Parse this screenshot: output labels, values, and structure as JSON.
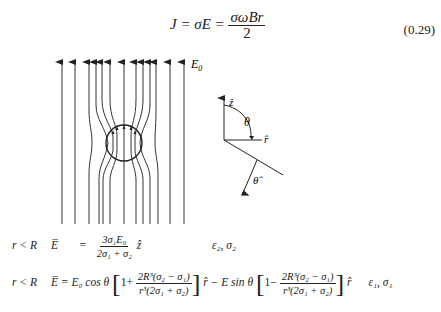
{
  "equation_top": {
    "lhs": "J = σE =",
    "fraction_numerator": "σωBr",
    "fraction_denominator": "2",
    "number": "(0.29)"
  },
  "figure": {
    "field_label": "E",
    "field_label_sub": "0",
    "field_line_x": [
      62,
      75,
      89,
      96,
      102,
      110,
      124,
      136,
      143,
      150,
      156,
      170,
      184
    ],
    "sphere": {
      "cx": 124,
      "cy": 143,
      "r": 18
    },
    "axes": {
      "z_label": "ẑ",
      "r_label": "r̂",
      "theta_label": "θ",
      "theta_hat_label": "θ̂"
    }
  },
  "equations_bottom": [
    {
      "condition": "r < R",
      "lhs": "E̅",
      "equals": "=",
      "numerator": "3σ₁E₀",
      "denominator": "2σ₁ + σ₂",
      "unit_vector": "ẑ",
      "region_label": "ε₂, σ₂"
    },
    {
      "condition": "r < R",
      "lhs": "E̅ = E₀ cos θ",
      "bracket1_prefix": "1+",
      "bracket1_numerator": "2R³(σ₂ − σ₁)",
      "bracket1_denominator": "r³(2σ₁ + σ₂)",
      "middle": "r̂ − E sin θ",
      "bracket2_prefix": "1−",
      "bracket2_numerator": "2R³(σ₂ − σ₁)",
      "bracket2_denominator": "r³(2σ₁ + σ₂)",
      "unit_vector": "r̂",
      "region_label": "ε₁, σ₁"
    }
  ]
}
